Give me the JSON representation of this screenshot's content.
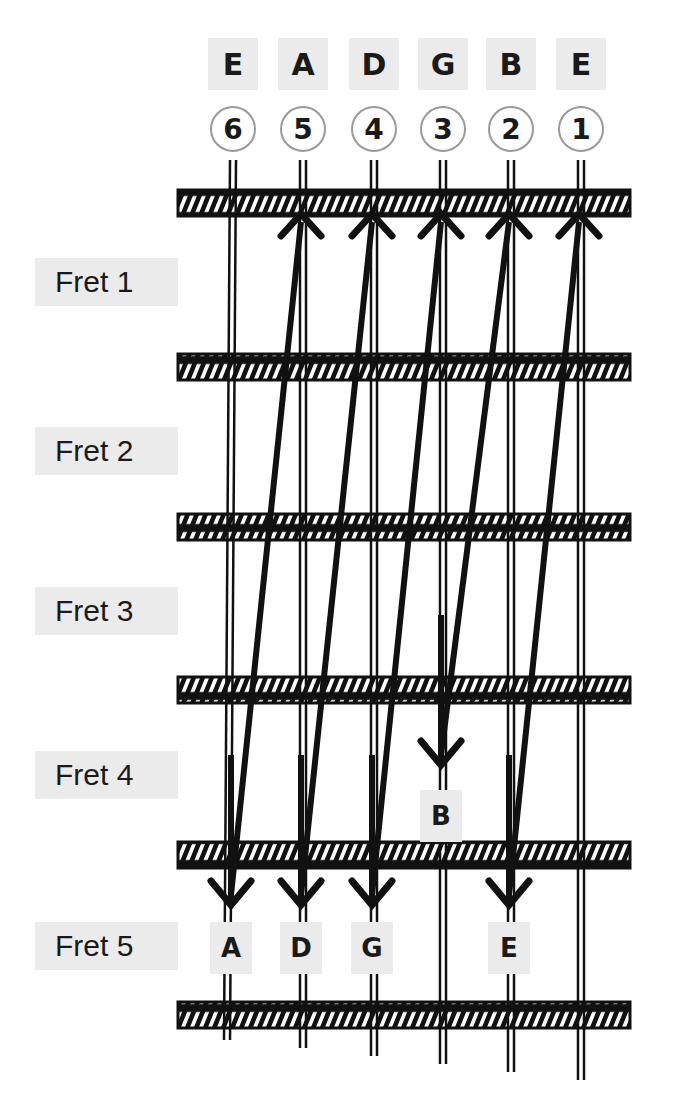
{
  "diagram": {
    "type": "guitar-tuning-fretboard",
    "strings": [
      {
        "number": "6",
        "name": "E",
        "x": 233
      },
      {
        "number": "5",
        "name": "A",
        "x": 303
      },
      {
        "number": "4",
        "name": "D",
        "x": 374
      },
      {
        "number": "3",
        "name": "G",
        "x": 443
      },
      {
        "number": "2",
        "name": "B",
        "x": 511
      },
      {
        "number": "1",
        "name": "E",
        "x": 581
      }
    ],
    "frets": [
      {
        "label": "Fret 1",
        "y": 282
      },
      {
        "label": "Fret 2",
        "y": 451
      },
      {
        "label": "Fret 3",
        "y": 611
      },
      {
        "label": "Fret 4",
        "y": 775
      },
      {
        "label": "Fret 5",
        "y": 946
      }
    ],
    "fret_lines_y": [
      203,
      367,
      527,
      690,
      855,
      1015
    ],
    "tuning_notes": [
      {
        "note": "A",
        "string": "6",
        "fret": "5",
        "target_string": "5"
      },
      {
        "note": "D",
        "string": "5",
        "fret": "5",
        "target_string": "4"
      },
      {
        "note": "G",
        "string": "4",
        "fret": "5",
        "target_string": "3"
      },
      {
        "note": "B",
        "string": "3",
        "fret": "4",
        "target_string": "2"
      },
      {
        "note": "E",
        "string": "2",
        "fret": "5",
        "target_string": "1"
      }
    ]
  }
}
